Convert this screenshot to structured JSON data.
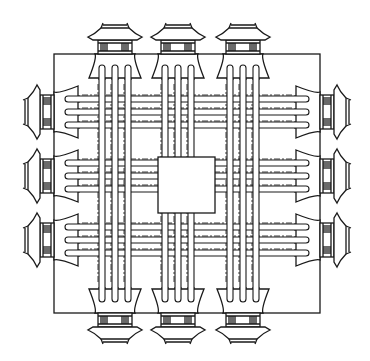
{
  "diagram": {
    "type": "city-plan",
    "description": "Ideal square walled city plan with three gates per side, nine-by-nine road grid and central palace enclosure",
    "colors": {
      "ink": "#1a1a1a",
      "background": "#ffffff"
    },
    "wall": {
      "x": 54,
      "y": 54,
      "width": 266,
      "height": 259
    },
    "palace": {
      "x": 158,
      "y": 157,
      "width": 57,
      "height": 56,
      "label": "palace"
    },
    "gates": {
      "top": [
        {
          "cx": 115
        },
        {
          "cx": 178
        },
        {
          "cx": 243
        }
      ],
      "bottom": [
        {
          "cx": 115
        },
        {
          "cx": 178
        },
        {
          "cx": 243
        }
      ],
      "left": [
        {
          "cy": 112
        },
        {
          "cy": 176
        },
        {
          "cy": 240
        }
      ],
      "right": [
        {
          "cy": 112
        },
        {
          "cy": 176
        },
        {
          "cy": 240
        }
      ]
    },
    "roads_per_gate": 3,
    "road_spacing": 13,
    "gate_count": 12,
    "text": []
  }
}
